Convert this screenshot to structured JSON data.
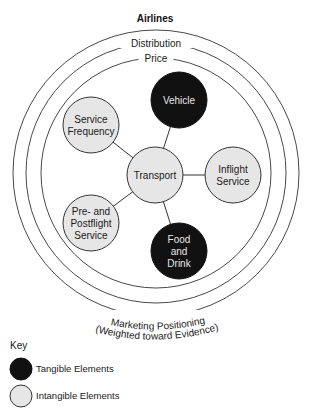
{
  "title": "Airlines",
  "rings": [
    {
      "id": "marketing",
      "label": "",
      "r": 143
    },
    {
      "id": "distribution",
      "label": "Distribution",
      "r": 130
    },
    {
      "id": "price",
      "label": "Price",
      "r": 115
    }
  ],
  "bottom_label": {
    "line1": "Marketing Positioning",
    "line2": "(Weighted toward Evidence)"
  },
  "center": {
    "x": 156,
    "y": 173
  },
  "hub": {
    "id": "transport",
    "lines": [
      "Transport"
    ],
    "x": 155,
    "y": 175,
    "r": 28,
    "type": "intangible"
  },
  "nodes": [
    {
      "id": "vehicle",
      "lines": [
        "Vehicle"
      ],
      "x": 179,
      "y": 100,
      "r": 28,
      "type": "tangible"
    },
    {
      "id": "service-frequency",
      "lines": [
        "Service",
        "Frequency"
      ],
      "x": 91,
      "y": 125,
      "r": 28,
      "type": "intangible"
    },
    {
      "id": "inflight-service",
      "lines": [
        "Inflight",
        "Service"
      ],
      "x": 233,
      "y": 175,
      "r": 28,
      "type": "intangible"
    },
    {
      "id": "pre-postflight-service",
      "lines": [
        "Pre- and",
        "Postflight",
        "Service"
      ],
      "x": 91,
      "y": 223,
      "r": 28,
      "type": "intangible"
    },
    {
      "id": "food-and-drink",
      "lines": [
        "Food",
        "and",
        "Drink"
      ],
      "x": 179,
      "y": 251,
      "r": 28,
      "type": "tangible"
    }
  ],
  "key": {
    "title": "Key",
    "items": [
      {
        "label": "Tangible Elements",
        "type": "tangible"
      },
      {
        "label": "Intangible Elements",
        "type": "intangible"
      }
    ]
  },
  "colors": {
    "tangible_fill": "#111111",
    "intangible_fill": "#e6e6e6",
    "stroke": "#333333"
  }
}
